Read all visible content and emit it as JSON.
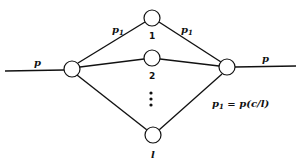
{
  "diagram": {
    "type": "parallel-path network",
    "input_label": "p",
    "output_label": "p",
    "branch_label": "p",
    "branch_subscript": "1",
    "nodes": [
      {
        "id": "source",
        "label": ""
      },
      {
        "id": "sink",
        "label": ""
      },
      {
        "id": "n1",
        "label": "1"
      },
      {
        "id": "n2",
        "label": "2"
      },
      {
        "id": "nl",
        "label": "l"
      }
    ],
    "ellipsis": "⋮",
    "equation": {
      "lhs": "p",
      "lhs_sub": "1",
      "rhs": " = p(c/l)"
    }
  }
}
